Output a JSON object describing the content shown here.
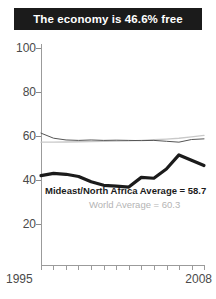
{
  "title": {
    "text": "The economy is 46.6% free"
  },
  "annotations": {
    "primary": "Mideast/North Africa Average = 58.7",
    "secondary": "World Average = 60.3"
  },
  "colors": {
    "banner_background": "#1b1b1b",
    "banner_text": "#ffffff",
    "primary_line": "#1b1b1b",
    "region_line": "#555555",
    "world_line": "#c9c9c9",
    "axis": "#9b9b9b",
    "tick_text": "#4a4a4a",
    "secondary_text": "#b4b4b4"
  },
  "chart_data": {
    "type": "line",
    "title": "The economy is 46.6% free",
    "xlabel": "",
    "ylabel": "",
    "xlim": [
      1995,
      2008
    ],
    "ylim": [
      0,
      100
    ],
    "yticks": [
      100,
      80,
      60,
      40,
      20
    ],
    "xticks": [
      1995,
      1996,
      1997,
      1998,
      1999,
      2000,
      2001,
      2002,
      2003,
      2004,
      2005,
      2006,
      2007,
      2008
    ],
    "xtick_labels_shown": [
      "1995",
      "2008"
    ],
    "grid": false,
    "legend": "annotation-inline",
    "x": [
      1995,
      1996,
      1997,
      1998,
      1999,
      2000,
      2001,
      2002,
      2003,
      2004,
      2005,
      2006,
      2007,
      2008
    ],
    "series": [
      {
        "name": "Country economic freedom",
        "color": "#1b1b1b",
        "width": 3.2,
        "values": [
          42.0,
          43.0,
          42.6,
          41.6,
          39.2,
          37.6,
          37.2,
          36.8,
          41.2,
          40.8,
          45.0,
          51.4,
          49.0,
          46.6
        ]
      },
      {
        "name": "Mideast/North Africa Average",
        "color": "#555555",
        "width": 1.0,
        "values": [
          61.3,
          59.0,
          58.2,
          58.0,
          58.2,
          58.0,
          58.1,
          58.0,
          57.9,
          58.0,
          57.6,
          57.2,
          58.4,
          58.7
        ]
      },
      {
        "name": "World Average",
        "color": "#c9c9c9",
        "width": 1.4,
        "values": [
          57.2,
          57.2,
          57.3,
          57.4,
          57.5,
          57.6,
          57.7,
          57.8,
          58.0,
          58.3,
          58.6,
          59.0,
          59.6,
          60.3
        ]
      }
    ],
    "averages": {
      "mideast_north_africa": 58.7,
      "world": 60.3,
      "country_latest": 46.6
    }
  }
}
